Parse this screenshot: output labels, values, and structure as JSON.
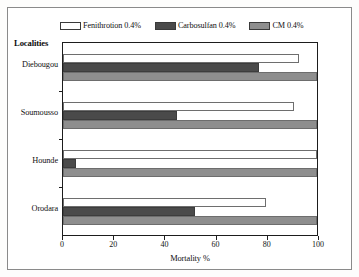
{
  "chart_data": {
    "type": "bar",
    "orientation": "horizontal",
    "title": "",
    "xlabel": "Mortality %",
    "ylabel": "Localities",
    "categories": [
      "Diebougou",
      "Soumousso",
      "Hounde",
      "Orodara"
    ],
    "series": [
      {
        "name": "Fenithrotion 0.4%",
        "color": "#ffffff",
        "values": [
          93,
          91,
          100,
          80
        ]
      },
      {
        "name": "Carbosulfan 0.4%",
        "color": "#4a4a4a",
        "values": [
          77,
          45,
          5,
          52
        ]
      },
      {
        "name": "CM 0.4%",
        "color": "#8e8e8e",
        "values": [
          100,
          100,
          100,
          100
        ]
      }
    ],
    "xlim": [
      0,
      100
    ],
    "xticks": [
      0,
      20,
      40,
      60,
      80,
      100
    ],
    "xtick_labels": [
      "0",
      "20",
      "40",
      "60",
      "80",
      "100"
    ],
    "grid": false,
    "legend_position": "top"
  },
  "legend": {
    "items": [
      {
        "label": "Fenithrotion 0.4%",
        "swatch": "legend-swatch-fenithrotion"
      },
      {
        "label": "Carbosulfan 0.4%",
        "swatch": "legend-swatch-carbosulfan"
      },
      {
        "label": "CM 0.4%",
        "swatch": "legend-swatch-cm"
      }
    ]
  },
  "axis": {
    "y_axis_title": "Localities",
    "x_axis_title": "Mortality %",
    "y_labels": [
      "Diebougou",
      "Soumousso",
      "Hounde",
      "Orodara"
    ],
    "x_labels": [
      "0",
      "20",
      "40",
      "60",
      "80",
      "100"
    ]
  }
}
